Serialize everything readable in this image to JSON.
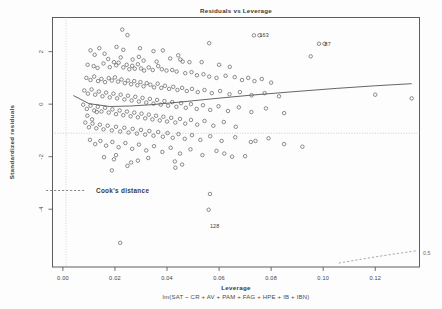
{
  "figure": {
    "kind": "r-diagnostic-plot",
    "title": "Residuals vs Leverage",
    "background_color": "#ffffff",
    "ink_color": "#4a4a4a"
  },
  "chart_data": {
    "type": "scatter",
    "title": "Residuals vs Leverage",
    "xlabel": "Leverage",
    "xlabel_sub": "lm(SAT ~ CR + AV + PAM + FAG + HPE + IB + IBN)",
    "ylabel": "Standardized residuals",
    "xlim": [
      -0.004,
      0.137
    ],
    "ylim": [
      -6.2,
      3.3
    ],
    "xticks": [
      0.0,
      0.02,
      0.04,
      0.06,
      0.08,
      0.1,
      0.12
    ],
    "xticklabels": [
      "0.00",
      "0.02",
      "0.04",
      "0.06",
      "0.08",
      "0.10",
      "0.12"
    ],
    "yticks": [
      2,
      0,
      -2,
      -4
    ],
    "yticklabels": [
      "2",
      "0",
      "-2",
      "-4"
    ],
    "grid": false,
    "legend_position": "inside-left",
    "legend_entries": [
      "Cook's distance"
    ],
    "marker": "open-circle",
    "reference_lines": {
      "horizontal_zero": 0,
      "vertical_zero": 0.0
    },
    "annotations": [
      {
        "text": "163",
        "x": 0.0755,
        "y": 2.62,
        "marker": "o"
      },
      {
        "text": "87",
        "x": 0.1005,
        "y": 2.3,
        "marker": "o"
      },
      {
        "text": "128",
        "x": 0.0565,
        "y": -4.62,
        "marker": ""
      },
      {
        "text": "0.5",
        "x": 0.1355,
        "y": -5.55,
        "marker": ""
      }
    ],
    "smoother": {
      "name": "loess",
      "x": [
        0.004,
        0.01,
        0.018,
        0.026,
        0.034,
        0.045,
        0.058,
        0.072,
        0.088,
        0.105,
        0.12,
        0.134
      ],
      "y": [
        0.33,
        0.02,
        -0.09,
        -0.07,
        -0.02,
        0.08,
        0.21,
        0.34,
        0.47,
        0.6,
        0.7,
        0.78
      ]
    },
    "cook_contour": {
      "label": "0.5",
      "x": [
        0.106,
        0.113,
        0.121,
        0.129,
        0.136
      ],
      "y": [
        -6.05,
        -5.93,
        -5.8,
        -5.68,
        -5.58
      ]
    },
    "series": [
      {
        "name": "observations",
        "points": [
          [
            0.0228,
            2.84
          ],
          [
            0.0248,
            2.63
          ],
          [
            0.0562,
            2.32
          ],
          [
            0.0755,
            2.62
          ],
          [
            0.1005,
            2.3
          ],
          [
            0.0106,
            2.05
          ],
          [
            0.014,
            2.13
          ],
          [
            0.0206,
            2.18
          ],
          [
            0.0232,
            2.07
          ],
          [
            0.0296,
            2.13
          ],
          [
            0.0348,
            2.02
          ],
          [
            0.0384,
            2.05
          ],
          [
            0.0952,
            1.82
          ],
          [
            0.0122,
            1.88
          ],
          [
            0.016,
            1.92
          ],
          [
            0.0174,
            1.72
          ],
          [
            0.0222,
            1.78
          ],
          [
            0.0268,
            1.7
          ],
          [
            0.0292,
            1.8
          ],
          [
            0.031,
            1.66
          ],
          [
            0.036,
            1.62
          ],
          [
            0.0412,
            1.74
          ],
          [
            0.0443,
            1.86
          ],
          [
            0.0451,
            1.7
          ],
          [
            0.046,
            1.62
          ],
          [
            0.0486,
            1.6
          ],
          [
            0.0533,
            1.6
          ],
          [
            0.06,
            1.5
          ],
          [
            0.0641,
            1.42
          ],
          [
            0.0095,
            1.5
          ],
          [
            0.0118,
            1.45
          ],
          [
            0.0133,
            1.38
          ],
          [
            0.0156,
            1.55
          ],
          [
            0.018,
            1.41
          ],
          [
            0.0196,
            1.6
          ],
          [
            0.0205,
            1.48
          ],
          [
            0.0214,
            1.58
          ],
          [
            0.0232,
            1.4
          ],
          [
            0.0245,
            1.5
          ],
          [
            0.0255,
            1.33
          ],
          [
            0.0266,
            1.46
          ],
          [
            0.0276,
            1.35
          ],
          [
            0.0288,
            1.52
          ],
          [
            0.03,
            1.36
          ],
          [
            0.0312,
            1.28
          ],
          [
            0.033,
            1.4
          ],
          [
            0.0345,
            1.3
          ],
          [
            0.0366,
            1.45
          ],
          [
            0.038,
            1.33
          ],
          [
            0.0398,
            1.28
          ],
          [
            0.042,
            1.3
          ],
          [
            0.0437,
            1.24
          ],
          [
            0.047,
            1.18
          ],
          [
            0.0494,
            1.22
          ],
          [
            0.0515,
            1.1
          ],
          [
            0.054,
            1.14
          ],
          [
            0.0562,
            1.05
          ],
          [
            0.059,
            1.0
          ],
          [
            0.0625,
            1.08
          ],
          [
            0.066,
            1.03
          ],
          [
            0.0688,
            0.92
          ],
          [
            0.0712,
            1.0
          ],
          [
            0.0736,
            0.88
          ],
          [
            0.0764,
            0.96
          ],
          [
            0.08,
            0.82
          ],
          [
            0.009,
            1.0
          ],
          [
            0.0106,
            0.92
          ],
          [
            0.012,
            1.05
          ],
          [
            0.0135,
            0.88
          ],
          [
            0.0148,
            0.96
          ],
          [
            0.0162,
            0.84
          ],
          [
            0.0176,
            0.99
          ],
          [
            0.0188,
            0.9
          ],
          [
            0.02,
            1.02
          ],
          [
            0.0212,
            0.86
          ],
          [
            0.0225,
            0.94
          ],
          [
            0.0238,
            0.8
          ],
          [
            0.025,
            0.9
          ],
          [
            0.0262,
            0.76
          ],
          [
            0.0274,
            0.88
          ],
          [
            0.0286,
            0.72
          ],
          [
            0.0298,
            0.84
          ],
          [
            0.031,
            0.68
          ],
          [
            0.0322,
            0.8
          ],
          [
            0.0336,
            0.74
          ],
          [
            0.035,
            0.64
          ],
          [
            0.0364,
            0.78
          ],
          [
            0.0378,
            0.62
          ],
          [
            0.0392,
            0.7
          ],
          [
            0.0408,
            0.58
          ],
          [
            0.0424,
            0.66
          ],
          [
            0.044,
            0.54
          ],
          [
            0.0458,
            0.62
          ],
          [
            0.0476,
            0.5
          ],
          [
            0.0496,
            0.58
          ],
          [
            0.0518,
            0.46
          ],
          [
            0.0544,
            0.54
          ],
          [
            0.0572,
            0.42
          ],
          [
            0.0604,
            0.5
          ],
          [
            0.064,
            0.38
          ],
          [
            0.068,
            0.46
          ],
          [
            0.0725,
            0.34
          ],
          [
            0.0775,
            0.42
          ],
          [
            0.083,
            0.3
          ],
          [
            0.12,
            0.36
          ],
          [
            0.134,
            0.22
          ],
          [
            0.0082,
            0.52
          ],
          [
            0.0096,
            0.4
          ],
          [
            0.011,
            0.56
          ],
          [
            0.0124,
            0.36
          ],
          [
            0.0138,
            0.48
          ],
          [
            0.0152,
            0.3
          ],
          [
            0.0166,
            0.44
          ],
          [
            0.018,
            0.26
          ],
          [
            0.0194,
            0.4
          ],
          [
            0.0208,
            0.22
          ],
          [
            0.0222,
            0.36
          ],
          [
            0.0236,
            0.18
          ],
          [
            0.025,
            0.32
          ],
          [
            0.0264,
            0.14
          ],
          [
            0.0278,
            0.28
          ],
          [
            0.0292,
            0.1
          ],
          [
            0.0306,
            0.24
          ],
          [
            0.032,
            0.06
          ],
          [
            0.0334,
            0.2
          ],
          [
            0.0348,
            0.02
          ],
          [
            0.0362,
            0.16
          ],
          [
            0.0376,
            -0.02
          ],
          [
            0.039,
            0.12
          ],
          [
            0.0404,
            -0.06
          ],
          [
            0.042,
            0.08
          ],
          [
            0.0436,
            -0.1
          ],
          [
            0.0454,
            0.04
          ],
          [
            0.0472,
            -0.14
          ],
          [
            0.0492,
            0.0
          ],
          [
            0.0514,
            -0.18
          ],
          [
            0.0538,
            -0.04
          ],
          [
            0.0566,
            -0.22
          ],
          [
            0.0598,
            -0.08
          ],
          [
            0.0634,
            -0.26
          ],
          [
            0.0676,
            -0.12
          ],
          [
            0.0724,
            -0.3
          ],
          [
            0.078,
            -0.16
          ],
          [
            0.085,
            -0.34
          ],
          [
            0.0078,
            -0.02
          ],
          [
            0.0092,
            -0.18
          ],
          [
            0.0106,
            -0.06
          ],
          [
            0.012,
            -0.24
          ],
          [
            0.0134,
            -0.1
          ],
          [
            0.0148,
            -0.28
          ],
          [
            0.0162,
            -0.14
          ],
          [
            0.0176,
            -0.32
          ],
          [
            0.019,
            -0.2
          ],
          [
            0.0204,
            -0.38
          ],
          [
            0.0218,
            -0.24
          ],
          [
            0.0232,
            -0.42
          ],
          [
            0.0246,
            -0.28
          ],
          [
            0.026,
            -0.46
          ],
          [
            0.0274,
            -0.32
          ],
          [
            0.0288,
            -0.5
          ],
          [
            0.0302,
            -0.36
          ],
          [
            0.0316,
            -0.54
          ],
          [
            0.033,
            -0.4
          ],
          [
            0.0344,
            -0.58
          ],
          [
            0.0358,
            -0.44
          ],
          [
            0.0372,
            -0.62
          ],
          [
            0.0386,
            -0.48
          ],
          [
            0.04,
            -0.66
          ],
          [
            0.0416,
            -0.52
          ],
          [
            0.0432,
            -0.7
          ],
          [
            0.045,
            -0.56
          ],
          [
            0.047,
            -0.74
          ],
          [
            0.0492,
            -0.6
          ],
          [
            0.0516,
            -0.78
          ],
          [
            0.0544,
            -0.64
          ],
          [
            0.0578,
            -0.82
          ],
          [
            0.0618,
            -0.68
          ],
          [
            0.0664,
            -0.86
          ],
          [
            0.0086,
            -0.7
          ],
          [
            0.01,
            -0.88
          ],
          [
            0.0114,
            -0.74
          ],
          [
            0.0128,
            -0.92
          ],
          [
            0.0142,
            -0.78
          ],
          [
            0.0156,
            -0.96
          ],
          [
            0.0172,
            -0.82
          ],
          [
            0.0188,
            -1.0
          ],
          [
            0.0204,
            -0.86
          ],
          [
            0.022,
            -1.04
          ],
          [
            0.0236,
            -0.9
          ],
          [
            0.0252,
            -1.08
          ],
          [
            0.0268,
            -0.94
          ],
          [
            0.0284,
            -1.12
          ],
          [
            0.03,
            -0.98
          ],
          [
            0.0316,
            -1.16
          ],
          [
            0.0332,
            -1.02
          ],
          [
            0.0348,
            -1.2
          ],
          [
            0.0366,
            -1.06
          ],
          [
            0.0384,
            -1.24
          ],
          [
            0.0402,
            -1.1
          ],
          [
            0.0422,
            -1.28
          ],
          [
            0.0444,
            -1.14
          ],
          [
            0.0468,
            -1.32
          ],
          [
            0.0496,
            -1.18
          ],
          [
            0.0528,
            -1.36
          ],
          [
            0.0566,
            -1.22
          ],
          [
            0.061,
            -1.4
          ],
          [
            0.0662,
            -1.26
          ],
          [
            0.0722,
            -1.44
          ],
          [
            0.079,
            -1.3
          ],
          [
            0.092,
            -1.62
          ],
          [
            0.0104,
            -1.36
          ],
          [
            0.0124,
            -1.52
          ],
          [
            0.0144,
            -1.4
          ],
          [
            0.0166,
            -1.58
          ],
          [
            0.019,
            -1.44
          ],
          [
            0.0214,
            -1.64
          ],
          [
            0.024,
            -1.48
          ],
          [
            0.0266,
            -1.7
          ],
          [
            0.0292,
            -1.54
          ],
          [
            0.032,
            -1.76
          ],
          [
            0.035,
            -1.6
          ],
          [
            0.0382,
            -1.82
          ],
          [
            0.0414,
            -1.66
          ],
          [
            0.045,
            -1.88
          ],
          [
            0.049,
            -1.72
          ],
          [
            0.0536,
            -1.94
          ],
          [
            0.059,
            -1.78
          ],
          [
            0.065,
            -2.0
          ],
          [
            0.0288,
            -2.15
          ],
          [
            0.0328,
            -2.05
          ],
          [
            0.0262,
            -2.22
          ],
          [
            0.0196,
            -2.1
          ],
          [
            0.043,
            -2.18
          ],
          [
            0.0248,
            -2.35
          ],
          [
            0.07,
            -1.98
          ],
          [
            0.085,
            -1.52
          ],
          [
            0.0188,
            -2.52
          ],
          [
            0.0432,
            -2.42
          ],
          [
            0.0565,
            -3.42
          ],
          [
            0.056,
            -4.02
          ],
          [
            0.022,
            -5.28
          ],
          [
            0.0094,
            -0.44
          ],
          [
            0.0112,
            -0.58
          ],
          [
            0.013,
            -0.3
          ],
          [
            0.0458,
            -2.3
          ],
          [
            0.062,
            -1.88
          ],
          [
            0.074,
            -1.4
          ],
          [
            0.0158,
            -2.02
          ],
          [
            0.0204,
            -1.94
          ]
        ]
      }
    ]
  }
}
